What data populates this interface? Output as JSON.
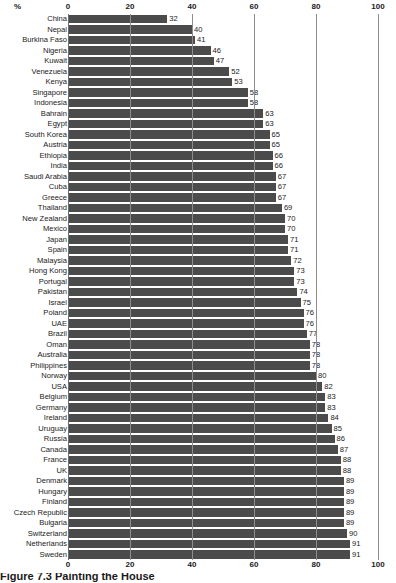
{
  "chart_data": {
    "type": "bar",
    "orientation": "horizontal",
    "title": "Figure 7.3  Painting the House",
    "xlabel": "%",
    "ylabel": "",
    "xlim": [
      0,
      100
    ],
    "xticks": [
      0,
      20,
      40,
      60,
      80,
      100
    ],
    "grid": true,
    "legend": null,
    "axis_top": true,
    "axis_bottom": true,
    "bar_color": "#4b4b4b",
    "categories": [
      "China",
      "Nepal",
      "Burkina Faso",
      "Nigeria",
      "Kuwait",
      "Venezuela",
      "Kenya",
      "Singapore",
      "Indonesia",
      "Bahrain",
      "Egypt",
      "South Korea",
      "Austria",
      "Ethiopia",
      "India",
      "Saudi Arabia",
      "Cuba",
      "Greece",
      "Thailand",
      "New Zealand",
      "Mexico",
      "Japan",
      "Spain",
      "Malaysia",
      "Hong Kong",
      "Portugal",
      "Pakistan",
      "Israel",
      "Poland",
      "UAE",
      "Brazil",
      "Oman",
      "Australia",
      "Philippines",
      "Norway",
      "USA",
      "Belgium",
      "Germany",
      "Ireland",
      "Uruguay",
      "Russia",
      "Canada",
      "France",
      "UK",
      "Denmark",
      "Hungary",
      "Finland",
      "Czech Republic",
      "Bulgaria",
      "Switzerland",
      "Netherlands",
      "Sweden"
    ],
    "values": [
      32,
      40,
      41,
      46,
      47,
      52,
      53,
      58,
      58,
      63,
      63,
      65,
      65,
      66,
      66,
      67,
      67,
      67,
      69,
      70,
      70,
      71,
      71,
      72,
      73,
      73,
      74,
      75,
      76,
      76,
      77,
      78,
      78,
      78,
      80,
      82,
      83,
      83,
      84,
      85,
      86,
      87,
      88,
      88,
      89,
      89,
      89,
      89,
      89,
      90,
      91,
      91
    ]
  },
  "caption": {
    "text": "Figure 7.3  Painting the House"
  }
}
